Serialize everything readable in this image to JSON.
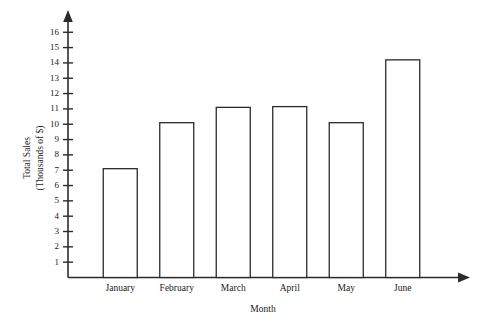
{
  "chart_data": {
    "type": "bar",
    "title": "",
    "categories": [
      "January",
      "February",
      "March",
      "April",
      "May",
      "June"
    ],
    "values": [
      7.1,
      10.1,
      11.1,
      11.15,
      10.1,
      14.2
    ],
    "xlabel": "Month",
    "ylabel": "Total Sales (Thousands of $)",
    "ylabel_line1": "Total Sales",
    "ylabel_line2": "(Thousands of $)",
    "yticks": [
      1,
      2,
      3,
      4,
      5,
      6,
      7,
      8,
      9,
      10,
      11,
      12,
      13,
      14,
      15,
      16
    ],
    "ytick_labels": [
      "1",
      "2",
      "3",
      "4",
      "5",
      "6",
      "7",
      "8",
      "9",
      "10",
      "11",
      "12",
      "13",
      "14",
      "15",
      "16"
    ],
    "ylim": [
      0,
      16.8
    ],
    "grid": false,
    "legend": false,
    "legend_position": "none",
    "bar_fill_color": "#ffffff",
    "bar_edge_color": "#2b2b2b",
    "axis_color": "#2b2b2b",
    "background_color": "#ffffff",
    "axis_style": "arrow-tipped"
  }
}
